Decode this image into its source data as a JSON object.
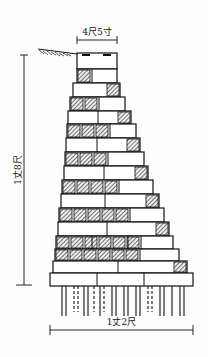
{
  "labels": {
    "top_width": "4尺5寸",
    "height": "1丈8尺",
    "base_width": "1丈2尺"
  },
  "colors": {
    "ink": "#111111",
    "hatch": "#222222",
    "background": "#fdfdfd"
  },
  "courses": [
    {
      "y": 53,
      "h": 16,
      "x1": 77,
      "x2": 117,
      "type": "cap",
      "splits": []
    },
    {
      "y": 69,
      "h": 14,
      "x1": 77,
      "x2": 117,
      "hatch": "left",
      "hcount": 1,
      "splits": []
    },
    {
      "y": 83,
      "h": 14,
      "x1": 73,
      "x2": 120,
      "hatch": "right",
      "hcount": 1,
      "splits": []
    },
    {
      "y": 97,
      "h": 14,
      "x1": 70,
      "x2": 125,
      "hatch": "left",
      "hcount": 2,
      "splits": []
    },
    {
      "y": 111,
      "h": 13,
      "x1": 68,
      "x2": 131,
      "hatch": "right",
      "hcount": 1,
      "splits": [
        98
      ]
    },
    {
      "y": 124,
      "h": 14,
      "x1": 67,
      "x2": 136,
      "hatch": "left",
      "hcount": 3,
      "splits": []
    },
    {
      "y": 138,
      "h": 14,
      "x1": 66,
      "x2": 140,
      "hatch": "right",
      "hcount": 1,
      "splits": [
        97
      ]
    },
    {
      "y": 152,
      "h": 14,
      "x1": 65,
      "x2": 144,
      "hatch": "left",
      "hcount": 3,
      "splits": []
    },
    {
      "y": 166,
      "h": 14,
      "x1": 64,
      "x2": 148,
      "hatch": "right",
      "hcount": 1,
      "splits": [
        104
      ]
    },
    {
      "y": 180,
      "h": 14,
      "x1": 62,
      "x2": 153,
      "hatch": "left",
      "hcount": 4,
      "splits": []
    },
    {
      "y": 194,
      "h": 14,
      "x1": 61,
      "x2": 159,
      "hatch": "right",
      "hcount": 1,
      "splits": [
        105
      ]
    },
    {
      "y": 208,
      "h": 14,
      "x1": 59,
      "x2": 164,
      "hatch": "left",
      "hcount": 5,
      "splits": []
    },
    {
      "y": 222,
      "h": 14,
      "x1": 58,
      "x2": 169,
      "hatch": "right",
      "hcount": 1,
      "splits": [
        107
      ]
    },
    {
      "y": 236,
      "h": 13,
      "x1": 56,
      "x2": 173,
      "hatch": "left",
      "hcount": 6,
      "splits": [
        92,
        128
      ]
    },
    {
      "y": 249,
      "h": 12,
      "x1": 55,
      "x2": 179,
      "hatch": "left",
      "hcount": 6,
      "splits": []
    },
    {
      "y": 261,
      "h": 12,
      "x1": 53,
      "x2": 187,
      "hatch": "right",
      "hcount": 1,
      "splits": [
        118
      ]
    },
    {
      "y": 273,
      "h": 13,
      "x1": 50,
      "x2": 193,
      "type": "base",
      "splits": [
        97,
        144
      ]
    }
  ],
  "piles": {
    "y1": 286,
    "y2": 316,
    "solid": [
      62,
      66,
      84,
      88,
      100,
      112,
      116,
      124,
      128,
      136,
      140,
      160,
      164,
      172,
      180,
      184
    ],
    "dashed": [
      74,
      78,
      94,
      104,
      148,
      152
    ]
  },
  "dims": {
    "top": {
      "y": 40,
      "x1": 77,
      "x2": 117,
      "text_y": 35
    },
    "base": {
      "y": 330,
      "x1": 50,
      "x2": 193,
      "text_y": 325
    },
    "height": {
      "x": 24,
      "y1": 55,
      "y2": 285
    }
  }
}
